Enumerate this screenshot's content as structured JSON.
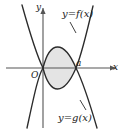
{
  "figure": {
    "type": "math-diagram",
    "background_color": "#ffffff",
    "curve_color": "#2b2b2b",
    "axis_color": "#555555",
    "shaded_region_fill": "#e4e4e4",
    "shaded_region_stroke": "#3a3a3a"
  },
  "axes": {
    "x_axis_label": "x",
    "y_axis_label": "y",
    "origin_label": "O",
    "x_axis_y_px": 68,
    "y_axis_x_px": 43,
    "has_arrowheads": true
  },
  "curves": [
    {
      "id": "f",
      "label": "y=f(x)",
      "shape": "upward-parabola",
      "description": "opens upward, vertex below x-axis between 0 and a"
    },
    {
      "id": "g",
      "label": "y=g(x)",
      "shape": "downward-parabola",
      "description": "opens downward, vertex above x-axis between 0 and a"
    }
  ],
  "marks": [
    {
      "id": "origin",
      "label": "O",
      "x_value": 0
    },
    {
      "id": "upper-limit",
      "label": "a",
      "x_value": "a"
    }
  ],
  "shaded_region": {
    "label": "",
    "between": [
      "g",
      "f"
    ],
    "from_x": 0,
    "to_x": "a",
    "fill": "#e4e4e4"
  }
}
